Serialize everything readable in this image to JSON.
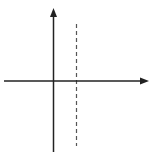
{
  "figure": {
    "function": "y = 4/(x - 2)",
    "axis_labels": {
      "x": "x",
      "y": "y"
    },
    "tick_labels": {
      "x": [
        {
          "value": -2,
          "text": "−2"
        },
        {
          "value": 3,
          "text": "3"
        },
        {
          "value": 5,
          "text": "5"
        }
      ],
      "y": [
        {
          "value": 4,
          "text": "4"
        },
        {
          "value": 1,
          "text": "1"
        },
        {
          "value": -2,
          "text": "−2"
        },
        {
          "value": -4,
          "text": "−4"
        }
      ]
    },
    "asymptote": {
      "type": "vertical",
      "x": 2,
      "style": "dashed"
    },
    "grid": {
      "x_range": [
        -3,
        7
      ],
      "y_range": [
        -5.5,
        5
      ],
      "step": 1
    },
    "colors": {
      "grid": "#bbbbbb",
      "axis": "#222222",
      "curve": "#333333"
    }
  }
}
